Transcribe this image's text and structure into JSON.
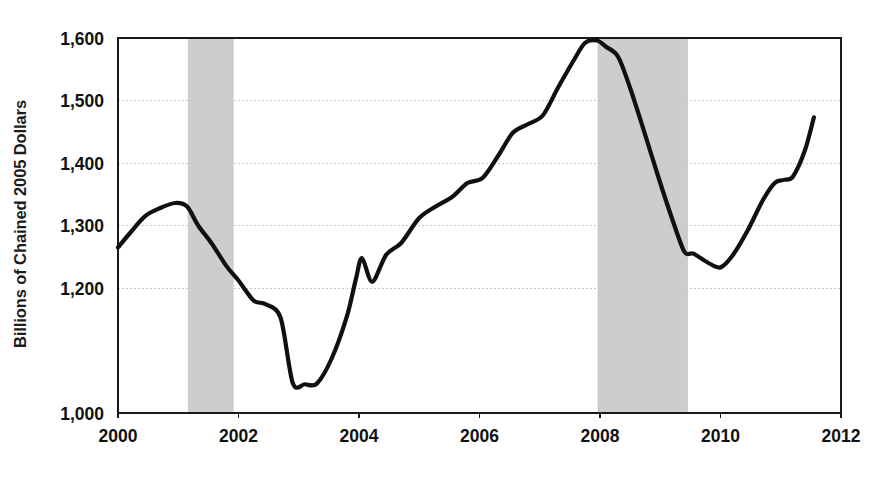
{
  "chart_data": {
    "type": "line",
    "title": "",
    "xlabel": "",
    "ylabel": "Billions of Chained 2005 Dollars",
    "xlim": [
      2000,
      2012
    ],
    "ylim": [
      1000,
      1600
    ],
    "grid": true,
    "legend": "none",
    "x_ticks": [
      "2000",
      "2002",
      "2004",
      "2006",
      "2008",
      "2010",
      "2012"
    ],
    "x_tick_values": [
      2000,
      2002,
      2004,
      2006,
      2008,
      2010,
      2012
    ],
    "y_ticks": [
      "1,000",
      "1,200",
      "1,300",
      "1,400",
      "1,500",
      "1,600"
    ],
    "y_tick_values": [
      1000,
      1200,
      1300,
      1400,
      1500,
      1600
    ],
    "gridline_values": [
      1200,
      1300,
      1400,
      1500
    ],
    "series": [
      {
        "name": "Real Business Equipment and Software Investment",
        "color": "#101010",
        "points": [
          [
            2000.0,
            1265
          ],
          [
            2000.2,
            1288
          ],
          [
            2000.45,
            1315
          ],
          [
            2000.7,
            1328
          ],
          [
            2000.95,
            1336
          ],
          [
            2001.15,
            1330
          ],
          [
            2001.33,
            1300
          ],
          [
            2001.55,
            1272
          ],
          [
            2001.8,
            1235
          ],
          [
            2002.0,
            1212
          ],
          [
            2002.25,
            1180
          ],
          [
            2002.45,
            1174
          ],
          [
            2002.7,
            1152
          ],
          [
            2002.9,
            1048
          ],
          [
            2003.1,
            1046
          ],
          [
            2003.3,
            1047
          ],
          [
            2003.55,
            1088
          ],
          [
            2003.8,
            1155
          ],
          [
            2003.95,
            1215
          ],
          [
            2004.05,
            1248
          ],
          [
            2004.22,
            1210
          ],
          [
            2004.45,
            1253
          ],
          [
            2004.7,
            1272
          ],
          [
            2005.0,
            1312
          ],
          [
            2005.3,
            1332
          ],
          [
            2005.55,
            1346
          ],
          [
            2005.8,
            1368
          ],
          [
            2006.05,
            1376
          ],
          [
            2006.3,
            1410
          ],
          [
            2006.55,
            1448
          ],
          [
            2006.8,
            1462
          ],
          [
            2007.05,
            1476
          ],
          [
            2007.3,
            1520
          ],
          [
            2007.55,
            1562
          ],
          [
            2007.75,
            1592
          ],
          [
            2007.95,
            1596
          ],
          [
            2008.1,
            1586
          ],
          [
            2008.3,
            1570
          ],
          [
            2008.5,
            1520
          ],
          [
            2008.75,
            1445
          ],
          [
            2009.0,
            1368
          ],
          [
            2009.2,
            1310
          ],
          [
            2009.4,
            1258
          ],
          [
            2009.55,
            1255
          ],
          [
            2009.8,
            1240
          ],
          [
            2010.0,
            1233
          ],
          [
            2010.2,
            1252
          ],
          [
            2010.45,
            1292
          ],
          [
            2010.7,
            1340
          ],
          [
            2010.9,
            1368
          ],
          [
            2011.05,
            1373
          ],
          [
            2011.2,
            1378
          ],
          [
            2011.4,
            1420
          ],
          [
            2011.55,
            1473
          ]
        ]
      }
    ],
    "shaded_regions": [
      {
        "label": "recession-2001",
        "x_start": 2001.16,
        "x_end": 2001.92,
        "color": "#c6c6c6"
      },
      {
        "label": "recession-2008-2009",
        "x_start": 2007.96,
        "x_end": 2009.46,
        "color": "#c6c6c6"
      }
    ],
    "annotations": []
  },
  "figure": {
    "background": "#ffffff",
    "axis_color": "#1a1a1a",
    "gridline_color": "#c9c9c9",
    "ghost_caption": ""
  }
}
